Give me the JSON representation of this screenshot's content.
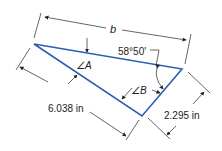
{
  "diagram": {
    "type": "triangle-dimensioned",
    "colors": {
      "triangle": "#2e5fb5",
      "dimension": "#222222"
    },
    "labels": {
      "side_b": "b",
      "angle_given": "58°50'",
      "angle_A": "∠A",
      "angle_B": "∠B",
      "side_left": "6.038 in",
      "side_right": "2.295 in"
    }
  }
}
